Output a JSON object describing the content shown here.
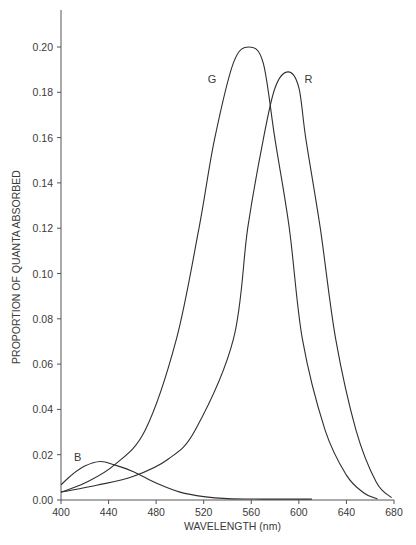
{
  "chart_data": {
    "type": "line",
    "title": "",
    "xlabel": "WAVELENGTH (nm)",
    "ylabel": "PROPORTION OF QUANTA ABSORBED",
    "xlim": [
      400,
      680
    ],
    "ylim": [
      0,
      0.217
    ],
    "xticks": [
      400,
      440,
      480,
      520,
      560,
      600,
      640,
      680
    ],
    "xtick_labels": [
      "400",
      "440",
      "480",
      "520",
      "560",
      "600",
      "640",
      "680"
    ],
    "yticks": [
      0.0,
      0.02,
      0.04,
      0.06,
      0.08,
      0.1,
      0.12,
      0.14,
      0.16,
      0.18,
      0.2
    ],
    "ytick_labels": [
      "0.00",
      "0.02",
      "0.04",
      "0.06",
      "0.08",
      "0.10",
      "0.12",
      "0.14",
      "0.16",
      "0.18",
      "0.20"
    ],
    "grid": false,
    "legend": "none (curves labeled inline)",
    "series": [
      {
        "name": "B",
        "label": "B",
        "label_at": [
          414,
          0.019
        ],
        "x": [
          400,
          410,
          420,
          433,
          445,
          461,
          480,
          500,
          520,
          540,
          570,
          611
        ],
        "y": [
          0.0067,
          0.0115,
          0.015,
          0.017,
          0.0155,
          0.0125,
          0.0075,
          0.0035,
          0.0015,
          0.0006,
          0.0004,
          0.0004
        ]
      },
      {
        "name": "G",
        "label": "G",
        "label_at": [
          527,
          0.186
        ],
        "x": [
          400,
          420,
          445,
          471,
          497,
          516,
          529,
          545,
          558,
          570,
          580,
          592,
          603,
          622,
          640,
          655,
          666
        ],
        "y": [
          0.0035,
          0.0075,
          0.0155,
          0.031,
          0.071,
          0.12,
          0.159,
          0.193,
          0.2,
          0.193,
          0.159,
          0.12,
          0.071,
          0.031,
          0.011,
          0.003,
          0.0005
        ]
      },
      {
        "name": "R",
        "label": "R",
        "label_at": [
          608,
          0.186
        ],
        "x": [
          400,
          430,
          461,
          490,
          513,
          545,
          557,
          570,
          580,
          591,
          600,
          606,
          618,
          631,
          648,
          665,
          678
        ],
        "y": [
          0.0035,
          0.0065,
          0.0105,
          0.018,
          0.031,
          0.071,
          0.12,
          0.159,
          0.182,
          0.189,
          0.182,
          0.159,
          0.12,
          0.071,
          0.031,
          0.008,
          0.001
        ]
      }
    ]
  }
}
